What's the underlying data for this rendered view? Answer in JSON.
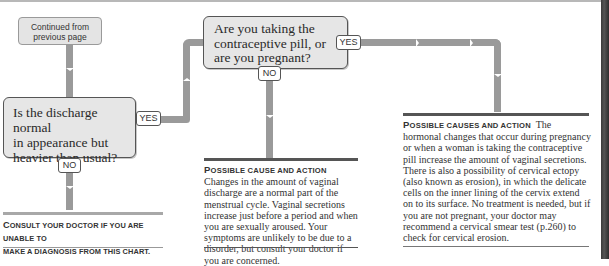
{
  "flowchart": {
    "start_box": {
      "line1": "Continued from",
      "line2": "previous page"
    },
    "question_1": {
      "line1": "Is the discharge normal",
      "line2": "in appearance but",
      "line3": "heavier than usual?",
      "yes_label": "YES",
      "no_label": "NO"
    },
    "question_2": {
      "line1": "Are you taking the",
      "line2": "contraceptive pill, or",
      "line3": "are you pregnant?",
      "yes_label": "YES",
      "no_label": "NO"
    },
    "consult_note": {
      "first_letter": "C",
      "line1_rest": "onsult your doctor if you are unable to",
      "line2": "make a diagnosis from this chart."
    },
    "outcome_no": {
      "heading_first": "P",
      "heading_rest": "ossible cause and action",
      "body": "Changes in the amount of vaginal discharge are a normal part of the menstrual cycle. Vaginal secretions increase just before a period and when you are sexually aroused. Your symptoms are unlikely to be due to a disorder, but consult your doctor if you are concerned."
    },
    "outcome_yes": {
      "heading_first": "P",
      "heading_rest": "ossible causes and action",
      "body": "The hormonal changes that occur during pregnancy or when a woman is taking the contraceptive pill increase the amount of vaginal secretions. There is also a possibility of cervical ectopy (also known as erosion), in which the delicate cells on the inner lining of the cervix extend on to its surface. No treatment is needed, but if you are not pregnant, your doctor may recommend a cervical smear test (p.260) to check for cervical erosion."
    }
  },
  "colors": {
    "box_fill": "#e6e6e6",
    "box_border": "#555555",
    "connector": "#9a9a9a",
    "rule_dark": "#555555",
    "page_edge": "#3a3a3a"
  }
}
